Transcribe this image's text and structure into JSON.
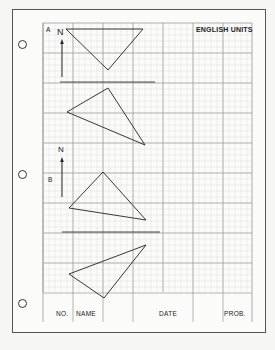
{
  "sheet": {
    "header_units": "ENGLISH UNITS",
    "holes": [
      {
        "cx": 22,
        "cy": 44
      },
      {
        "cx": 22,
        "cy": 174
      },
      {
        "cx": 22,
        "cy": 303
      }
    ],
    "grid": {
      "x0": 43,
      "y0": 23,
      "x1": 252,
      "y1": 322,
      "major_spacing": 30,
      "minor_per_major": 5,
      "major_color": "#9a9a9a",
      "minor_color": "#dcdcdc"
    }
  },
  "problems": [
    {
      "label": "A",
      "north_label": "N",
      "north_arrow": {
        "x": 62,
        "y_top": 39,
        "y_bottom": 77
      },
      "separator": {
        "x1": 60,
        "x2": 155,
        "y": 82
      },
      "triangles": [
        {
          "name": "plan-triangle",
          "points": [
            [
              66,
              29
            ],
            [
              143,
              29
            ],
            [
              108,
              70
            ]
          ]
        },
        {
          "name": "front-triangle",
          "points": [
            [
              108,
              88
            ],
            [
              67,
              112
            ],
            [
              145,
              145
            ]
          ]
        }
      ]
    },
    {
      "label": "B",
      "north_label": "N",
      "north_arrow": {
        "x": 62,
        "y_top": 157,
        "y_bottom": 197
      },
      "separator": {
        "x1": 62,
        "x2": 160,
        "y": 232
      },
      "triangles": [
        {
          "name": "plan-triangle",
          "points": [
            [
              103,
              172
            ],
            [
              69,
              208
            ],
            [
              146,
              220
            ]
          ]
        },
        {
          "name": "front-triangle",
          "points": [
            [
              146,
              245
            ],
            [
              69,
              274
            ],
            [
              104,
              298
            ]
          ]
        }
      ]
    }
  ],
  "title_block": {
    "no_label": "NO.",
    "name_label": "NAME",
    "date_label": "DATE",
    "prob_label": "PROB."
  }
}
